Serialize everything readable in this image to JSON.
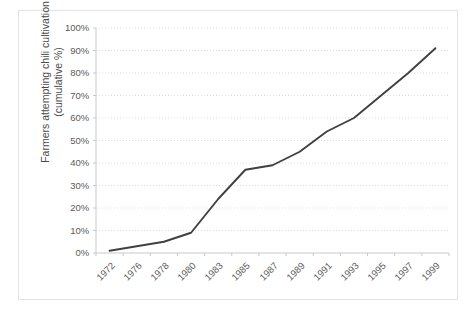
{
  "chart_data": {
    "type": "line",
    "title": "",
    "xlabel": "",
    "ylabel": "Farmers attempting chili cultivation (cumulative %)",
    "ylim": [
      0,
      100
    ],
    "yticks": [
      0,
      10,
      20,
      30,
      40,
      50,
      60,
      70,
      80,
      90,
      100
    ],
    "ytick_labels": [
      "0%",
      "10%",
      "20%",
      "30%",
      "40%",
      "50%",
      "60%",
      "70%",
      "80%",
      "90%",
      "100%"
    ],
    "categories": [
      "1972",
      "1976",
      "1978",
      "1980",
      "1983",
      "1985",
      "1987",
      "1989",
      "1991",
      "1993",
      "1995",
      "1997",
      "1999"
    ],
    "values": [
      1,
      3,
      5,
      9,
      24,
      37,
      39,
      45,
      54,
      60,
      70,
      80,
      91
    ],
    "series": [
      {
        "name": "Farmers attempting chili cultivation (cumulative %)",
        "color": "#404040",
        "values": [
          1,
          3,
          5,
          9,
          24,
          37,
          39,
          45,
          54,
          60,
          70,
          80,
          91
        ]
      }
    ],
    "grid": true,
    "grid_axis": "y",
    "grid_style": "dotted",
    "grid_color": "#dcdcdc",
    "legend": false,
    "legend_position": "none",
    "line_color": "#404040",
    "line_width": 2,
    "markers": false,
    "axis_color": "#c9c9c9",
    "plot_background": "#ffffff",
    "border_color": "#e3e3e3"
  }
}
